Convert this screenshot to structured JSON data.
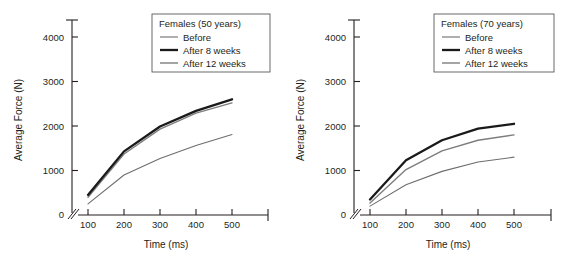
{
  "figure": {
    "background": "#ffffff",
    "panel_count": 2
  },
  "chart_data": [
    {
      "type": "line",
      "title": "Females (50 years)",
      "xlabel": "Time (ms)",
      "ylabel": "Average Force (N)",
      "x": [
        100,
        200,
        300,
        400,
        500
      ],
      "xticks": [
        "100",
        "200",
        "300",
        "400",
        "500"
      ],
      "yticks": [
        "0",
        "1000",
        "2000",
        "3000",
        "4000"
      ],
      "xlim": [
        60,
        560
      ],
      "ylim": [
        0,
        4400
      ],
      "grid": false,
      "axis_break": true,
      "legend_position": "top-right",
      "series": [
        {
          "name": "Before",
          "values": [
            250,
            900,
            1270,
            1560,
            1810
          ],
          "color": "#6e6e6e",
          "width": 1.1
        },
        {
          "name": "After 8 weeks",
          "values": [
            450,
            1430,
            1990,
            2340,
            2600
          ],
          "color": "#1a1a1a",
          "width": 2.3
        },
        {
          "name": "After 12 weeks",
          "values": [
            400,
            1370,
            1930,
            2290,
            2520
          ],
          "color": "#7d7d7d",
          "width": 1.4
        }
      ]
    },
    {
      "type": "line",
      "title": "Females (70 years)",
      "xlabel": "Time (ms)",
      "ylabel": "Average Force (N)",
      "x": [
        100,
        200,
        300,
        400,
        500
      ],
      "xticks": [
        "100",
        "200",
        "300",
        "400",
        "500"
      ],
      "yticks": [
        "0",
        "1000",
        "2000",
        "3000",
        "4000"
      ],
      "xlim": [
        60,
        560
      ],
      "ylim": [
        0,
        4400
      ],
      "grid": false,
      "axis_break": true,
      "legend_position": "top-right",
      "series": [
        {
          "name": "Before",
          "values": [
            200,
            680,
            980,
            1190,
            1300
          ],
          "color": "#6e6e6e",
          "width": 1.1
        },
        {
          "name": "After 8 weeks",
          "values": [
            350,
            1230,
            1680,
            1940,
            2050
          ],
          "color": "#1a1a1a",
          "width": 2.3
        },
        {
          "name": "After 12 weeks",
          "values": [
            270,
            1020,
            1440,
            1680,
            1800
          ],
          "color": "#7d7d7d",
          "width": 1.4
        }
      ]
    }
  ]
}
